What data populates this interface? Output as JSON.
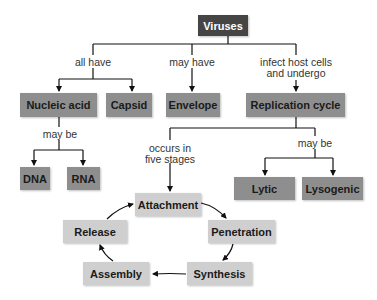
{
  "diagram": {
    "root": "Viruses",
    "links": {
      "all_have": "all have",
      "may_have": "may have",
      "infect_line1": "infect host cells",
      "infect_line2": "and undergo",
      "nucleic_may_be": "may be",
      "occurs_line1": "occurs in",
      "occurs_line2": "five stages",
      "cycle_may_be": "may be"
    },
    "level2": {
      "nucleic_acid": "Nucleic acid",
      "capsid": "Capsid",
      "envelope": "Envelope",
      "replication_cycle": "Replication cycle"
    },
    "nucleic_types": {
      "dna": "DNA",
      "rna": "RNA"
    },
    "cycle_types": {
      "lytic": "Lytic",
      "lysogenic": "Lysogenic"
    },
    "stages": {
      "attachment": "Attachment",
      "penetration": "Penetration",
      "synthesis": "Synthesis",
      "assembly": "Assembly",
      "release": "Release"
    },
    "colors": {
      "root_box": "#454545",
      "level_box": "#8e8e8e",
      "stage_box": "#cfcfcf",
      "line": "#111111"
    }
  }
}
